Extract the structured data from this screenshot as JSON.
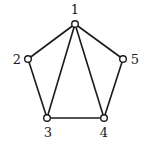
{
  "graph": {
    "nodes": [
      {
        "id": "1",
        "label": "1",
        "x": 75,
        "y": 24,
        "lx": 75,
        "ly": 14,
        "anchor": "middle"
      },
      {
        "id": "2",
        "label": "2",
        "x": 28,
        "y": 59,
        "lx": 17,
        "ly": 64,
        "anchor": "middle"
      },
      {
        "id": "3",
        "label": "3",
        "x": 47,
        "y": 118,
        "lx": 48,
        "ly": 137,
        "anchor": "middle"
      },
      {
        "id": "4",
        "label": "4",
        "x": 104,
        "y": 118,
        "lx": 104,
        "ly": 137,
        "anchor": "middle"
      },
      {
        "id": "5",
        "label": "5",
        "x": 123,
        "y": 59,
        "lx": 135,
        "ly": 64,
        "anchor": "middle"
      }
    ],
    "edges": [
      [
        "1",
        "2"
      ],
      [
        "1",
        "3"
      ],
      [
        "1",
        "4"
      ],
      [
        "1",
        "5"
      ],
      [
        "2",
        "3"
      ],
      [
        "3",
        "4"
      ],
      [
        "4",
        "5"
      ]
    ],
    "colors": {
      "stroke": "#1a1a1a",
      "node_fill": "#ffffff",
      "background": "#ffffff"
    }
  }
}
